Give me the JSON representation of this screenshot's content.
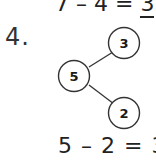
{
  "top_equation": {
    "left": "7",
    "operator": "–",
    "right": "4",
    "equals": "=",
    "answer": "3"
  },
  "question": {
    "number": "4.",
    "number_bond": {
      "whole": "5",
      "part_top": "3",
      "part_bottom": "2"
    },
    "equation": "5 – 2 = 3"
  }
}
